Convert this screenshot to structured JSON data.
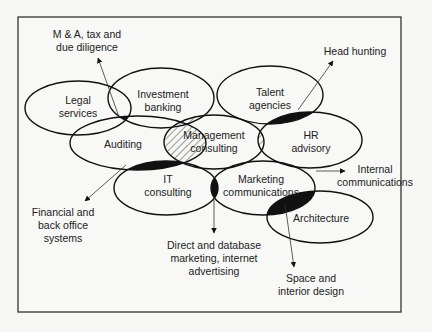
{
  "diagram": {
    "type": "overlapping-ellipses",
    "core": {
      "id": "management",
      "label": [
        "Management",
        "consulting"
      ]
    },
    "services": [
      {
        "id": "legal",
        "label": [
          "Legal",
          "services"
        ],
        "cx": 78,
        "cy": 108,
        "rx": 53,
        "ry": 27
      },
      {
        "id": "investment",
        "label": [
          "Investment",
          "banking"
        ],
        "cx": 161,
        "cy": 98,
        "rx": 53,
        "ry": 30
      },
      {
        "id": "auditing",
        "label": [
          "Auditing"
        ],
        "cx": 138,
        "cy": 143,
        "rx": 68,
        "ry": 27
      },
      {
        "id": "management",
        "label": [
          "Management",
          "consulting"
        ],
        "cx": 214,
        "cy": 142,
        "rx": 50,
        "ry": 27
      },
      {
        "id": "talent",
        "label": [
          "Talent",
          "agencies"
        ],
        "cx": 270,
        "cy": 95,
        "rx": 53,
        "ry": 29
      },
      {
        "id": "hr",
        "label": [
          "HR",
          "advisory"
        ],
        "cx": 310,
        "cy": 140,
        "rx": 52,
        "ry": 28
      },
      {
        "id": "it",
        "label": [
          "IT",
          "consulting"
        ],
        "cx": 166,
        "cy": 188,
        "rx": 52,
        "ry": 27
      },
      {
        "id": "marketing",
        "label": [
          "Marketing",
          "communications"
        ],
        "cx": 263,
        "cy": 188,
        "rx": 52,
        "ry": 27
      },
      {
        "id": "architecture",
        "label": [
          "Architecture"
        ],
        "cx": 320,
        "cy": 217,
        "rx": 53,
        "ry": 26
      }
    ],
    "hybrid_services": [
      {
        "label": [
          "M & A, tax and",
          "due diligence"
        ],
        "between": [
          "legal",
          "investment",
          "auditing"
        ]
      },
      {
        "label": [
          "Head hunting"
        ],
        "between": [
          "talent",
          "hr"
        ]
      },
      {
        "label": [
          "Internal",
          "communications"
        ],
        "between": [
          "hr",
          "marketing"
        ]
      },
      {
        "label": [
          "Financial and",
          "back office",
          "systems"
        ],
        "between": [
          "auditing",
          "it"
        ]
      },
      {
        "label": [
          "Direct and database",
          "marketing, internet",
          "advertising"
        ],
        "between": [
          "it",
          "marketing"
        ]
      },
      {
        "label": [
          "Space and",
          "interior design"
        ],
        "between": [
          "marketing",
          "architecture"
        ]
      }
    ],
    "legend": {
      "solid_black": "established hybrid service",
      "hatched": "overlap with management consulting"
    }
  }
}
